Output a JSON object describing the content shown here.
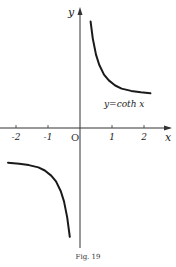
{
  "figure": {
    "caption": "Fig. 19"
  },
  "chart_data": {
    "type": "line",
    "title": "",
    "function_label": "y=coth x",
    "xlabel": "x",
    "ylabel": "y",
    "origin_label": "O",
    "x_ticks": [
      -2,
      -1,
      1,
      2
    ],
    "x_tick_labels": [
      "-2",
      "-1",
      "1",
      "2"
    ],
    "xlim": [
      -2.4,
      2.9
    ],
    "ylim": [
      -3.5,
      3.6
    ],
    "grid": false,
    "legend": "none",
    "asymptotes": {
      "vertical": 0,
      "horizontal": [
        1,
        -1
      ]
    },
    "series": [
      {
        "name": "coth x (x>0)",
        "x": [
          0.33,
          0.4,
          0.5,
          0.6,
          0.75,
          0.9,
          1.1,
          1.3,
          1.6,
          1.9,
          2.2
        ],
        "y": [
          3.13,
          2.63,
          2.16,
          1.86,
          1.57,
          1.4,
          1.25,
          1.16,
          1.09,
          1.05,
          1.02
        ]
      },
      {
        "name": "coth x (x<0)",
        "x": [
          -2.25,
          -1.9,
          -1.6,
          -1.3,
          -1.1,
          -0.9,
          -0.75,
          -0.6,
          -0.5,
          -0.4,
          -0.32
        ],
        "y": [
          -1.02,
          -1.05,
          -1.09,
          -1.16,
          -1.25,
          -1.4,
          -1.57,
          -1.86,
          -2.16,
          -2.63,
          -3.2
        ]
      }
    ]
  }
}
